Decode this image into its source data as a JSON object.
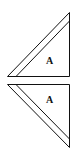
{
  "diagram": {
    "stroke_color": "#111111",
    "background": "#ffffff",
    "shapes": [
      {
        "id": "top-triangle",
        "label": "A",
        "orientation": "hypotenuse-up-left"
      },
      {
        "id": "bottom-triangle",
        "label": "A",
        "orientation": "hypotenuse-down-left"
      }
    ]
  }
}
